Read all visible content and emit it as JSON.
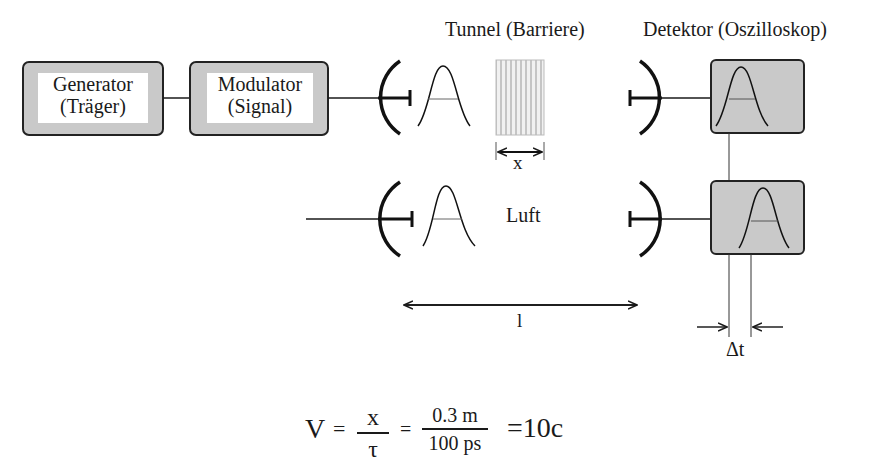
{
  "diagram": {
    "colors": {
      "box_fill": "#c9c9c9",
      "box_stroke": "#222222",
      "line": "#1a1a1a",
      "barrier": "#b8b8b8"
    },
    "blocks": {
      "generator": {
        "line1": "Generator",
        "line2": "(Träger)"
      },
      "modulator": {
        "line1": "Modulator",
        "line2": "(Signal)"
      }
    },
    "labels": {
      "tunnel": "Tunnel (Barriere)",
      "detector": "Detektor (Oszilloskop)",
      "air": "Luft",
      "barrier_width": "x",
      "distance": "l",
      "delta_t": "Δt"
    },
    "formula": {
      "lhs": "V",
      "eq1": "=",
      "frac1_num": "x",
      "frac1_den": "τ",
      "eq2": "=",
      "frac2_num": "0.3 m",
      "frac2_den": "100 ps",
      "result": "=10c"
    },
    "paths": [
      {
        "name": "tunnel-path",
        "components": [
          "transmitter-antenna",
          "pulse",
          "barrier",
          "receiver-antenna",
          "oscilloscope"
        ]
      },
      {
        "name": "air-path",
        "components": [
          "transmitter-antenna",
          "pulse",
          "receiver-antenna",
          "oscilloscope"
        ]
      }
    ]
  }
}
